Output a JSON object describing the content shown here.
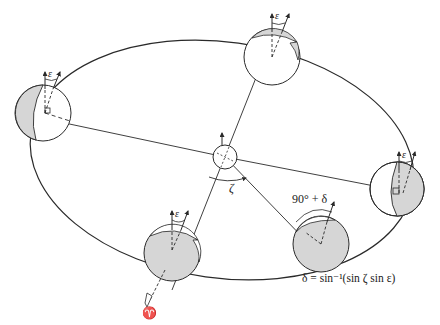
{
  "figure": {
    "title_fragment": "...(cut off at top)",
    "labels": {
      "epsilon": "ε",
      "zeta": "ζ",
      "angle_90_plus_delta": "90° + δ",
      "declination_formula": "δ = sin⁻¹(sin ζ sin ε)",
      "vernal_equinox_symbol": "♈"
    },
    "elements": {
      "orbit": "elliptical orbit around the Sun",
      "sun": "small central sphere",
      "earth_positions": [
        {
          "position": "left",
          "shading": "left crescent shaded",
          "axis_tilt_label": "ε"
        },
        {
          "position": "top",
          "shading": "thin top crescent shaded",
          "axis_tilt_label": "ε"
        },
        {
          "position": "right",
          "shading": "right portion shaded",
          "axis_tilt_label": "ε"
        },
        {
          "position": "bottom-right",
          "shading": "mostly shaded",
          "axis_tilt_label": "90° + δ"
        },
        {
          "position": "bottom-left",
          "shading": "mostly shaded",
          "axis_tilt_label": "ε"
        }
      ]
    },
    "colors": {
      "line": "#2a2a2a",
      "shade": "#d6d6d6",
      "background": "#ffffff"
    }
  }
}
